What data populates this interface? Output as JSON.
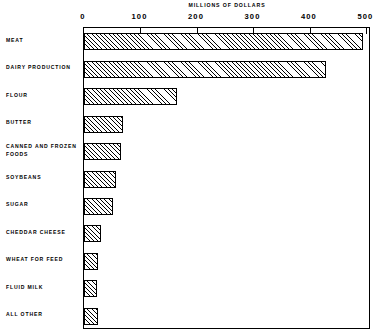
{
  "chart_data": {
    "type": "bar",
    "orientation": "horizontal",
    "title": "MILLIONS OF DOLLARS",
    "xlabel": "MILLIONS OF DOLLARS",
    "ylabel": "",
    "xlim": [
      0,
      508
    ],
    "xticks": [
      0,
      100,
      200,
      300,
      400,
      500
    ],
    "xtick_labels": [
      "0",
      "100",
      "200",
      "300",
      "400",
      "500"
    ],
    "grid": false,
    "legend": false,
    "categories": [
      "MEAT",
      "DAIRY PRODUCTION",
      "FLOUR",
      "BUTTER",
      "CANNED AND FROZEN FOODS",
      "SOYBEANS",
      "SUGAR",
      "CHEDDAR CHEESE",
      "WHEAT FOR FEED",
      "FLUID MILK",
      "ALL OTHER"
    ],
    "values": [
      493,
      428,
      165,
      69,
      66,
      56,
      52,
      30,
      25,
      23,
      25
    ]
  }
}
